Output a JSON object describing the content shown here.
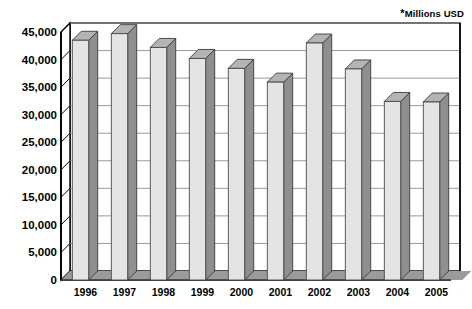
{
  "units_note": {
    "star": "*",
    "text": "Millions USD"
  },
  "chart_data": {
    "type": "bar",
    "title": "",
    "subtitle": "",
    "annotations": [
      "*Millions USD"
    ],
    "xlabel": "",
    "ylabel": "",
    "ylim": [
      0,
      45000
    ],
    "ytick_step": 5000,
    "grid": "horizontal",
    "legend": "none",
    "style": "3d-column",
    "categories": [
      "1996",
      "1997",
      "1998",
      "1999",
      "2000",
      "2001",
      "2002",
      "2003",
      "2004",
      "2005"
    ],
    "values": [
      43500,
      44700,
      42200,
      40200,
      38400,
      35900,
      43000,
      38300,
      32400,
      32300
    ],
    "ytick_labels": [
      "0",
      "5,000",
      "10,000",
      "15,000",
      "20,000",
      "25,000",
      "30,000",
      "35,000",
      "40,000",
      "45,000"
    ],
    "ytick_values": [
      0,
      5000,
      10000,
      15000,
      20000,
      25000,
      30000,
      35000,
      40000,
      45000
    ]
  },
  "colors": {
    "bar_face": "#e4e4e4",
    "bar_side": "#8f8f8f",
    "bar_top": "#b4b4b4",
    "grid": "#9a9a9a",
    "axis": "#000000",
    "floor_dark": "#2e2e2e",
    "floor_gray": "#9b9b9b",
    "background": "#ffffff"
  }
}
